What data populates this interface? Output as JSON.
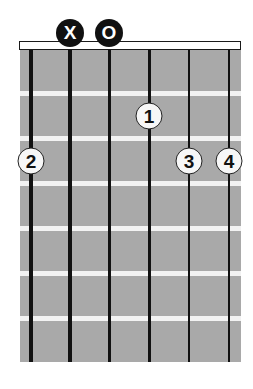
{
  "chord_diagram": {
    "string_count": 6,
    "fret_count": 6,
    "colors": {
      "board": "#a9a9a9",
      "fret": "#f2f2f2",
      "string": "#111111",
      "nut": "#ffffff"
    },
    "top_markers": [
      {
        "string": 2,
        "label": "X",
        "meaning": "muted"
      },
      {
        "string": 3,
        "label": "O",
        "meaning": "open"
      }
    ],
    "fingers": [
      {
        "string": 4,
        "fret": 1,
        "label": "1"
      },
      {
        "string": 1,
        "fret": 2,
        "label": "2"
      },
      {
        "string": 5,
        "fret": 2,
        "label": "3"
      },
      {
        "string": 6,
        "fret": 2,
        "label": "4"
      }
    ]
  }
}
